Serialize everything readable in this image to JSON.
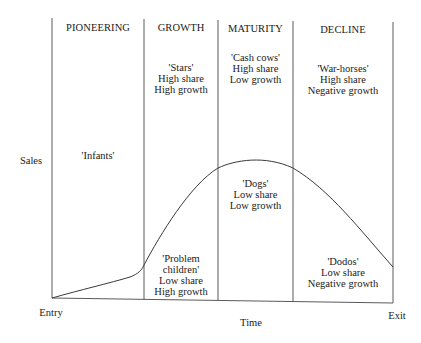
{
  "diagram": {
    "stages": [
      {
        "label": "PIONEERING"
      },
      {
        "label": "GROWTH"
      },
      {
        "label": "MATURITY"
      },
      {
        "label": "DECLINE"
      }
    ],
    "upper_labels": [
      {
        "stage": "PIONEERING",
        "lines": [
          "'Infants'"
        ]
      },
      {
        "stage": "GROWTH",
        "lines": [
          "'Stars'",
          "High share",
          "High growth"
        ]
      },
      {
        "stage": "MATURITY",
        "lines": [
          "'Cash cows'",
          "High share",
          "Low growth"
        ]
      },
      {
        "stage": "DECLINE",
        "lines": [
          "'War-horses'",
          "High share",
          "Negative growth"
        ]
      }
    ],
    "lower_labels": [
      {
        "stage": "GROWTH",
        "lines": [
          "'Problem",
          "children'",
          "Low share",
          "High growth"
        ]
      },
      {
        "stage": "MATURITY",
        "lines": [
          "'Dogs'",
          "Low share",
          "Low growth"
        ]
      },
      {
        "stage": "DECLINE",
        "lines": [
          "'Dodos'",
          "Low share",
          "Negative growth"
        ]
      }
    ],
    "axes": {
      "y_label": "Sales",
      "x_label": "Time",
      "x_start_label": "Entry",
      "x_end_label": "Exit"
    },
    "line_color": "#4a4a4a",
    "curve_description": "Product life cycle sales curve: slow rise in pioneering, steep rise in growth, plateau in maturity, falling in decline"
  }
}
